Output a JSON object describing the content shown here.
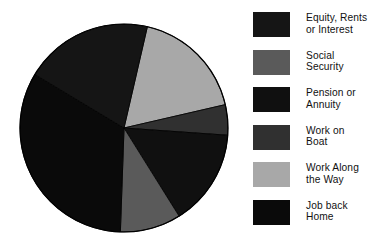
{
  "chart_data": {
    "type": "pie",
    "title": "",
    "subtitle": "",
    "xlabel": "",
    "ylabel": "",
    "grid": false,
    "legend_position": "right",
    "start_angle_deg": -77,
    "direction": "clockwise",
    "center": {
      "x": 124,
      "y": 128
    },
    "radius": 104,
    "categories": [
      "Equity, Rents\nor Interest",
      "Social\nSecurity",
      "Pension or\nAnnuity",
      "Work on\nBoat",
      "Work Along\nthe Way",
      "Job back\nHome"
    ],
    "values": [
      20.0,
      9.5,
      15.0,
      4.7,
      17.8,
      33.0
    ],
    "colors": [
      "#151515",
      "#5a5a5a",
      "#101010",
      "#303030",
      "#a8a8a8",
      "#0a0a0a"
    ],
    "series": [
      {
        "name": "Income source share",
        "values": [
          20.0,
          9.5,
          15.0,
          4.7,
          17.8,
          33.0
        ]
      }
    ],
    "slices": [
      {
        "label": "Work Along\nthe Way",
        "value": 17.8,
        "color": "#a8a8a8",
        "start_deg": -77,
        "end_deg": -13
      },
      {
        "label": "Work on\nBoat",
        "value": 4.7,
        "color": "#303030",
        "start_deg": -13,
        "end_deg": 4
      },
      {
        "label": "Pension or\nAnnuity",
        "value": 15.0,
        "color": "#101010",
        "start_deg": 4,
        "end_deg": 58
      },
      {
        "label": "Social\nSecurity",
        "value": 9.5,
        "color": "#5a5a5a",
        "start_deg": 58,
        "end_deg": 92
      },
      {
        "label": "Job back\nHome",
        "value": 33.0,
        "color": "#0a0a0a",
        "start_deg": 92,
        "end_deg": 211
      },
      {
        "label": "Equity, Rents\nor Interest",
        "value": 20.0,
        "color": "#151515",
        "start_deg": 211,
        "end_deg": 283
      }
    ],
    "annotations": []
  },
  "legend": {
    "items": [
      {
        "label": "Equity, Rents\nor Interest",
        "color": "#151515"
      },
      {
        "label": "Social\nSecurity",
        "color": "#5a5a5a"
      },
      {
        "label": "Pension or\nAnnuity",
        "color": "#101010"
      },
      {
        "label": "Work on\nBoat",
        "color": "#303030"
      },
      {
        "label": "Work Along\nthe Way",
        "color": "#a8a8a8"
      },
      {
        "label": "Job back\nHome",
        "color": "#0a0a0a"
      }
    ]
  },
  "canvas": {
    "background": "#ffffff",
    "outline_color": "#000000"
  }
}
